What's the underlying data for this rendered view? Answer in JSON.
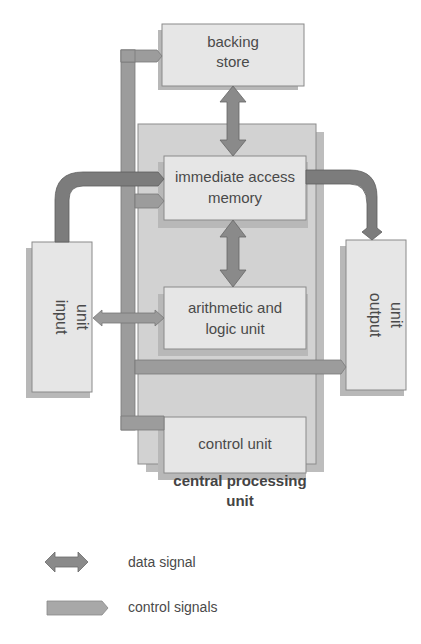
{
  "diagram": {
    "components": {
      "backing_store": {
        "line1": "backing",
        "line2": "store"
      },
      "memory": {
        "line1": "immediate access",
        "line2": "memory"
      },
      "alu": {
        "line1": "arithmetic and",
        "line2": "logic unit"
      },
      "control": {
        "label": "control unit"
      },
      "cpu": {
        "line1": "central processing",
        "line2": "unit"
      },
      "input": {
        "line1": "input",
        "line2": "unit"
      },
      "output": {
        "line1": "output",
        "line2": "unit"
      }
    },
    "legend": {
      "data": {
        "label": "data signal",
        "icon": "double-arrow-icon"
      },
      "control": {
        "label": "control signals",
        "icon": "single-arrow-icon"
      }
    },
    "colors": {
      "box_fill": "#e6e6e6",
      "box_border": "#8a8a8a",
      "cpu_fill": "#cfcfcf",
      "shadow": "#b5b5b5",
      "control_arrow": "#9a9a9a",
      "data_arrow": "#8a8a8a",
      "dark_arrow": "#777777"
    }
  }
}
